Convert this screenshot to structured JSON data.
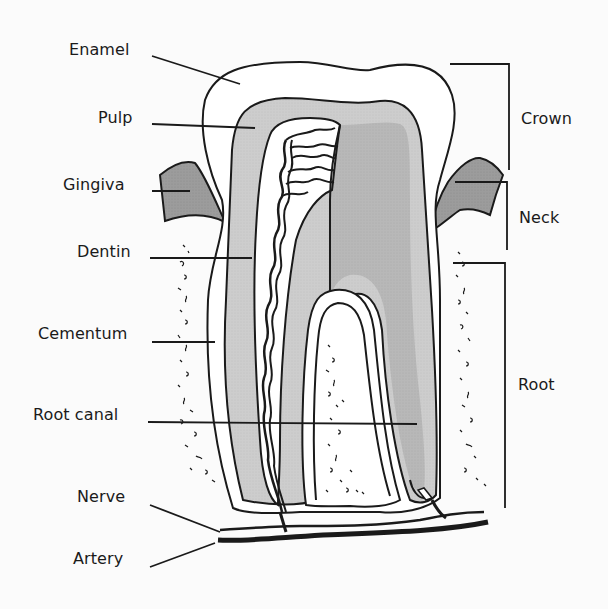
{
  "diagram": {
    "type": "anatomical-cross-section",
    "colors": {
      "background": "#fbfbfb",
      "outline": "#1a1a1a",
      "enamel": "#ffffff",
      "dentin_light": "#cfcfcf",
      "dentin_dark": "#b5b5b5",
      "gingiva": "#9a9a9a",
      "pulp": "#ffffff",
      "nerve": "#1a1a1a"
    },
    "left_labels": [
      {
        "id": "enamel",
        "text": "Enamel"
      },
      {
        "id": "pulp",
        "text": "Pulp"
      },
      {
        "id": "gingiva",
        "text": "Gingiva"
      },
      {
        "id": "dentin",
        "text": "Dentin"
      },
      {
        "id": "cementum",
        "text": "Cementum"
      },
      {
        "id": "root-canal",
        "text": "Root canal"
      },
      {
        "id": "nerve",
        "text": "Nerve"
      },
      {
        "id": "artery",
        "text": "Artery"
      }
    ],
    "right_labels": [
      {
        "id": "crown",
        "text": "Crown"
      },
      {
        "id": "neck",
        "text": "Neck"
      },
      {
        "id": "root",
        "text": "Root"
      }
    ]
  }
}
